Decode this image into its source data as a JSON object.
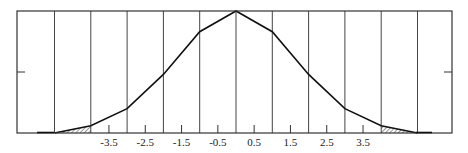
{
  "chart_data": {
    "type": "line",
    "title": "",
    "xlabel": "",
    "ylabel": "",
    "x": [
      -5,
      -4,
      -3,
      -2,
      -1,
      0,
      1,
      2,
      3,
      4,
      5
    ],
    "values": [
      0.0,
      0.06,
      0.2,
      0.48,
      0.83,
      1.0,
      0.83,
      0.48,
      0.2,
      0.06,
      0.0
    ],
    "tick_labels": [
      "-3.5",
      "-2.5",
      "-1.5",
      "-0.5",
      "0.5",
      "1.5",
      "2.5",
      "3.5"
    ],
    "tick_positions": [
      -3.5,
      -2.5,
      -1.5,
      -0.5,
      0.5,
      1.5,
      2.5,
      3.5
    ],
    "vertical_gridlines": [
      -5,
      -4,
      -3,
      -2,
      -1,
      0,
      1,
      2,
      3,
      4,
      5
    ],
    "shaded_regions": [
      {
        "from": -5,
        "to": -4,
        "pattern": "hatched"
      },
      {
        "from": 4,
        "to": 5,
        "pattern": "hatched"
      }
    ],
    "xlim": [
      -5.5,
      5.9
    ],
    "ylim": [
      0,
      1
    ],
    "grid": true,
    "legend": null
  },
  "colors": {
    "line": "#111111",
    "frame": "#333333",
    "grid": "#444444"
  }
}
